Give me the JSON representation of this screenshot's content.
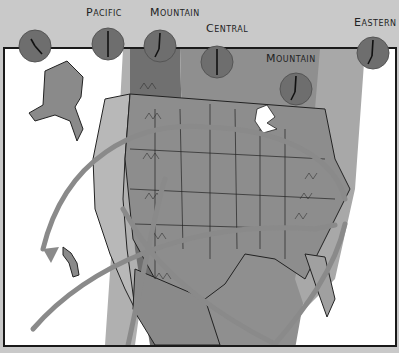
{
  "map": {
    "title": "North American Time Zones",
    "zones": [
      {
        "id": "alaska",
        "label": "",
        "clock_time": "4:00"
      },
      {
        "id": "pacific",
        "label": "Pacific",
        "clock_time": "6:00"
      },
      {
        "id": "mountain",
        "label": "Mountain",
        "clock_time": "7:00"
      },
      {
        "id": "central",
        "label": "Central",
        "clock_time": "6:00"
      },
      {
        "id": "mountain2",
        "label": "Mountain",
        "clock_time": "7:00"
      },
      {
        "id": "eastern",
        "label": "Eastern",
        "clock_time": "7:00"
      }
    ],
    "colors": {
      "background": "#c9c9c9",
      "clock_fill": "#6e6e6e",
      "clock_hand": "#1a1a1a",
      "land_light": "#b5b5b5",
      "land_mid": "#9a9a9a",
      "band_dark": "#6f6f6f",
      "route_arrow": "#8a8a8a",
      "water": "#ffffff"
    }
  }
}
